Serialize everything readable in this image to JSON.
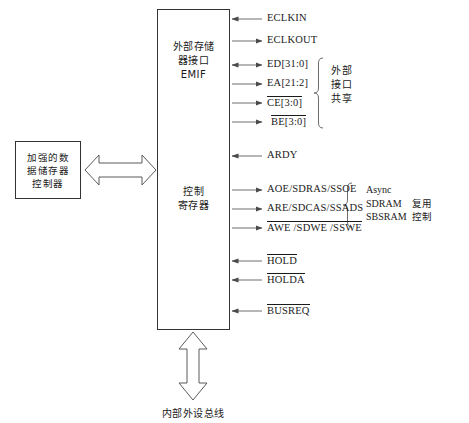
{
  "diagram": {
    "blocks": {
      "memory_controller": {
        "lines": [
          "加强的数",
          "据储存器",
          "控制器"
        ]
      },
      "emif": {
        "title_lines": [
          "外部存储",
          "器接口",
          "EMIF"
        ],
        "control_register_lines": [
          "控制",
          "寄存器"
        ]
      }
    },
    "signals": [
      {
        "name": "ECLKIN",
        "direction": "in",
        "overline": false,
        "y": 19
      },
      {
        "name": "ECLKOUT",
        "direction": "out",
        "overline": false,
        "y": 41
      },
      {
        "name": "ED[31:0]",
        "direction": "bidirectional",
        "overline": false,
        "y": 65
      },
      {
        "name": "EA[21:2]",
        "direction": "out",
        "overline": false,
        "y": 84
      },
      {
        "name": "CE[3:0]",
        "direction": "out",
        "overline": true,
        "y": 103
      },
      {
        "name": "BE[3:0]",
        "direction": "out",
        "overline": true,
        "y": 122
      },
      {
        "name": "ARDY",
        "direction": "in",
        "overline": false,
        "y": 156
      },
      {
        "name": "AOE/SDRAS/SSOE",
        "direction": "out",
        "overline": false,
        "y": 190
      },
      {
        "name": "ARE/SDCAS/SSADS",
        "direction": "out",
        "overline": false,
        "y": 209
      },
      {
        "name": "AWE /SDWE /SSWE",
        "direction": "out",
        "overline": true,
        "y": 228
      },
      {
        "name": "HOLD",
        "direction": "in",
        "overline": true,
        "y": 261
      },
      {
        "name": "HOLDA",
        "direction": "in",
        "overline": true,
        "y": 280
      },
      {
        "name": "BUSREQ",
        "direction": "in",
        "overline": true,
        "y": 311
      }
    ],
    "annotations": {
      "shared_interface": {
        "lines": [
          "外部",
          "接口",
          "共享"
        ]
      },
      "mux_control": {
        "english_lines": [
          "Async",
          "SDRAM",
          "SBSRAM"
        ],
        "chinese_lines": [
          "复用",
          "控制"
        ]
      }
    },
    "bus_label": "内部外设总线"
  }
}
